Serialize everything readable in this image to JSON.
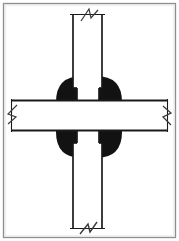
{
  "figure": {
    "title": "Beam-to-column moment connection detail",
    "type": "engineering-section-drawing",
    "canvas": {
      "width": 179,
      "height": 241
    },
    "colors": {
      "background": "#ffffff",
      "ink": "#1a1a1a",
      "fill_solid": "#121212",
      "frame": "#8c8c8c",
      "frame_inner": "#d8d8d8"
    },
    "frame": {
      "name": "figure-border",
      "x": 3,
      "y": 3,
      "width": 173,
      "height": 235,
      "stroke_width": 1.2
    },
    "members": {
      "column": {
        "label": "vertical-column",
        "orientation": "vertical",
        "left_edge_x": 72,
        "right_edge_x": 103,
        "width": 31,
        "top_y": 14,
        "bottom_y": 229,
        "stroke_width": 1.6
      },
      "beam": {
        "label": "horizontal-beam",
        "orientation": "horizontal",
        "top_edge_y": 100,
        "bottom_edge_y": 131,
        "height": 31,
        "left_x": 11,
        "right_x": 168,
        "stroke_width": 1.6
      },
      "weld_blob": {
        "label": "solid-weld-connection-region",
        "shape": "rounded-square",
        "center_x": 89,
        "center_y": 117,
        "half_width": 33,
        "half_height": 41,
        "corner_radius": 26,
        "fill": "#121212"
      },
      "notch_top": {
        "label": "column-web-notch-upper",
        "x": 76,
        "y": 88,
        "width": 23,
        "height": 13
      },
      "notch_bottom": {
        "label": "column-web-notch-lower",
        "x": 76,
        "y": 131,
        "width": 23,
        "height": 12
      }
    },
    "break_symbols": [
      {
        "name": "break-symbol-top",
        "location": "column-top",
        "cx": 88,
        "cy": 15
      },
      {
        "name": "break-symbol-bottom",
        "location": "column-bottom",
        "cx": 88,
        "cy": 228
      },
      {
        "name": "break-symbol-left",
        "location": "beam-left",
        "cx": 12,
        "cy": 116
      },
      {
        "name": "break-symbol-right",
        "location": "beam-right",
        "cx": 167,
        "cy": 116
      }
    ],
    "annotations": {
      "has_dimensions": false,
      "has_text_labels": false,
      "note": ""
    }
  }
}
